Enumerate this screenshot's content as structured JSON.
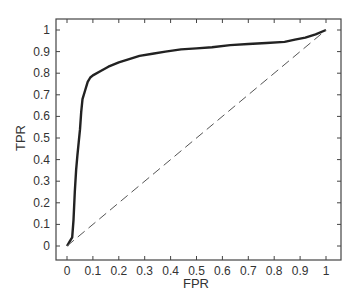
{
  "chart_data": {
    "type": "line",
    "title": "",
    "xlabel": "FPR",
    "ylabel": "TPR",
    "xlim": [
      0,
      1
    ],
    "ylim": [
      0,
      1
    ],
    "grid": false,
    "legend": null,
    "xticks": [
      "0",
      "0.1",
      "0.2",
      "0.3",
      "0.4",
      "0.5",
      "0.6",
      "0.7",
      "0.8",
      "0.9",
      "1"
    ],
    "yticks": [
      "0",
      "0.1",
      "0.2",
      "0.3",
      "0.4",
      "0.5",
      "0.6",
      "0.7",
      "0.8",
      "0.9",
      "1"
    ],
    "series": [
      {
        "name": "ROC curve",
        "style": "solid",
        "color": "#222222",
        "x": [
          0,
          0.01,
          0.02,
          0.025,
          0.03,
          0.035,
          0.04,
          0.045,
          0.05,
          0.055,
          0.06,
          0.07,
          0.08,
          0.09,
          0.1,
          0.13,
          0.16,
          0.2,
          0.24,
          0.28,
          0.33,
          0.38,
          0.44,
          0.5,
          0.56,
          0.63,
          0.7,
          0.77,
          0.84,
          0.88,
          0.92,
          0.96,
          1
        ],
        "y": [
          0,
          0.02,
          0.04,
          0.12,
          0.25,
          0.35,
          0.42,
          0.48,
          0.54,
          0.62,
          0.68,
          0.72,
          0.76,
          0.78,
          0.79,
          0.81,
          0.83,
          0.85,
          0.865,
          0.88,
          0.89,
          0.9,
          0.91,
          0.915,
          0.92,
          0.93,
          0.935,
          0.94,
          0.945,
          0.955,
          0.965,
          0.98,
          1
        ]
      },
      {
        "name": "Random classifier",
        "style": "dashed",
        "color": "#555555",
        "x": [
          0,
          1
        ],
        "y": [
          0,
          1
        ]
      }
    ]
  }
}
